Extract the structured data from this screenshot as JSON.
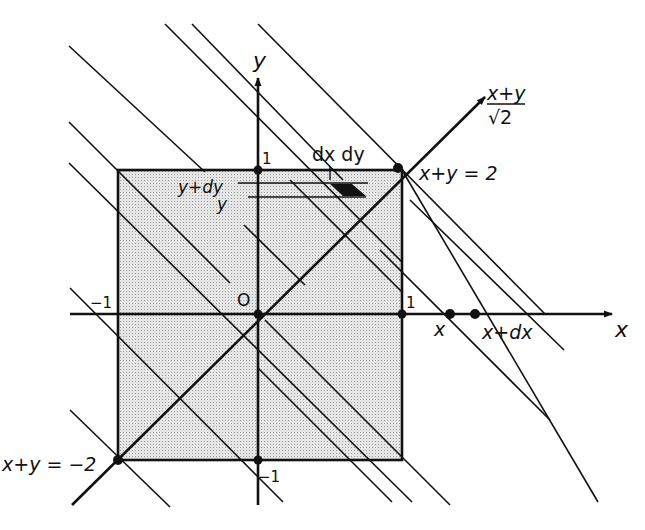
{
  "diagram": {
    "type": "coordinate-geometry",
    "colors": {
      "ink": "#111111",
      "fill": "#d4d4d4",
      "background": "#ffffff"
    },
    "axes": {
      "x_label": "x",
      "y_label": "y",
      "diag_label_num": "x+y",
      "diag_label_den": "√2"
    },
    "ticks": {
      "origin": "O",
      "x_pos": "1",
      "x_neg": "−1",
      "y_pos": "1",
      "y_neg": "−1"
    },
    "annotations": {
      "line_top": "x+y = 2",
      "line_bottom": "x+y = −2",
      "area_element": "dx dy",
      "y_level_upper": "y+dy",
      "y_level_lower": "y",
      "x_point": "x",
      "x_point_dx": "x+dx"
    }
  }
}
